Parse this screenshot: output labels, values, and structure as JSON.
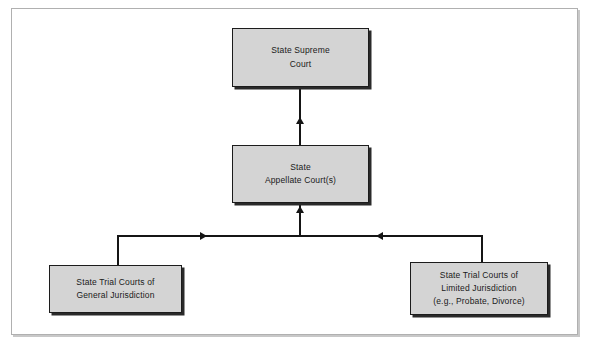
{
  "figure": {
    "type": "hierarchy-flowchart",
    "title": "",
    "nodes": [
      {
        "id": "supreme",
        "name": "state-supreme-court",
        "lines": [
          "State Supreme",
          "Court"
        ]
      },
      {
        "id": "appellate",
        "name": "state-appellate-courts",
        "lines": [
          "State",
          "Appellate Court(s)"
        ]
      },
      {
        "id": "trial_general",
        "name": "state-trial-courts-general-jurisdiction",
        "lines": [
          "State Trial Courts of",
          "General Jurisdiction"
        ]
      },
      {
        "id": "trial_limited",
        "name": "state-trial-courts-limited-jurisdiction",
        "lines": [
          "State Trial Courts of",
          "Limited Jurisdiction",
          "(e.g., Probate, Divorce)"
        ]
      }
    ],
    "edges": [
      {
        "from": "appellate",
        "to": "supreme",
        "arrow": "up"
      },
      {
        "from": "trial_general",
        "to": "appellate",
        "arrow": "up"
      },
      {
        "from": "trial_limited",
        "to": "appellate",
        "arrow": "up"
      }
    ],
    "colors": {
      "node_fill": "#d4d4d4",
      "node_border": "#1c1c1c",
      "node_shadow": "#2a2a2a",
      "connector": "#151515",
      "frame_border": "#b0b0b0",
      "background": "#ffffff",
      "text": "#1a1a1a"
    }
  }
}
